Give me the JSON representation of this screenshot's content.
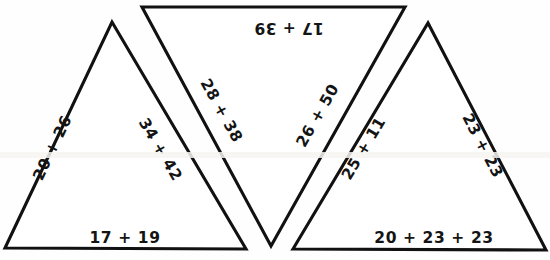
{
  "page": {
    "background_color": "#ffffff",
    "stroke_color": "#111111",
    "text_color": "#141414",
    "width": 550,
    "height": 260
  },
  "shapes": [
    {
      "name": "triangle-left",
      "orientation": "upright",
      "points": "5,248 112,22 246,249",
      "labels": {
        "left_side": "20 + 26",
        "right_side": "34 + 42",
        "base": "17 + 19"
      }
    },
    {
      "name": "triangle-middle",
      "orientation": "inverted",
      "points": "142,7 405,7 271,246",
      "labels": {
        "top_side": "17 + 39",
        "left_side": "28 + 38",
        "right_side": "26 + 50"
      }
    },
    {
      "name": "triangle-right",
      "orientation": "upright",
      "points": "293,249 428,23 546,250",
      "labels": {
        "left_side": "25 + 11",
        "right_side": "23 + 23",
        "base": "20 + 23 + 23"
      }
    }
  ]
}
